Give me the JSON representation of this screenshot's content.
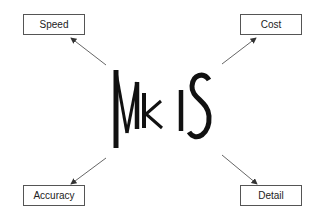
{
  "diagram": {
    "center": {
      "label": "MkIS"
    },
    "nodes": [
      {
        "id": "speed",
        "label": "Speed",
        "position": "top-left"
      },
      {
        "id": "cost",
        "label": "Cost",
        "position": "top-right"
      },
      {
        "id": "accuracy",
        "label": "Accuracy",
        "position": "bottom-left"
      },
      {
        "id": "detail",
        "label": "Detail",
        "position": "bottom-right"
      }
    ],
    "edges": [
      {
        "from": "MkIS",
        "to": "speed"
      },
      {
        "from": "MkIS",
        "to": "cost"
      },
      {
        "from": "MkIS",
        "to": "accuracy"
      },
      {
        "from": "MkIS",
        "to": "detail"
      }
    ],
    "colors": {
      "line": "#555555",
      "text": "#222222",
      "logo": "#111111"
    }
  }
}
